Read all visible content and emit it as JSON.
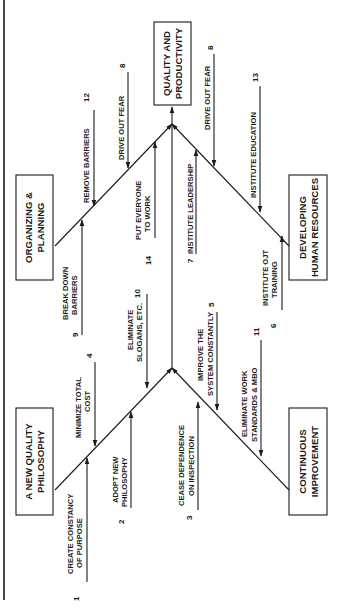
{
  "diagram": {
    "type": "cause-and-effect",
    "orientation": "rotated-90-ccw",
    "effect": {
      "label_lines": [
        "QUALITY AND",
        "PRODUCTIVITY"
      ]
    },
    "categories": [
      {
        "id": "philosophy",
        "label_lines": [
          "A NEW QUALITY",
          "PHILOSOPHY"
        ]
      },
      {
        "id": "organizing",
        "label_lines": [
          "ORGANIZING &",
          "PLANNING"
        ]
      },
      {
        "id": "continuous",
        "label_lines": [
          "CONTINUOUS",
          "IMPROVEMENT"
        ]
      },
      {
        "id": "human",
        "label_lines": [
          "DEVELOPING",
          "HUMAN RESOURCES"
        ]
      }
    ],
    "points": [
      {
        "num": "1",
        "lines": [
          "CREATE CONSTANCY",
          "OF PURPOSE"
        ]
      },
      {
        "num": "2",
        "lines": [
          "ADOPT NEW",
          "PHILOSOPHY"
        ]
      },
      {
        "num": "4",
        "lines": [
          "MINIMIZE TOTAL",
          "COST"
        ]
      },
      {
        "num": "10",
        "lines": [
          "ELIMINATE",
          "SLOGANS, ETC."
        ]
      },
      {
        "num": "9",
        "lines": [
          "BREAK DOWN",
          "BARRIERS"
        ]
      },
      {
        "num": "12",
        "lines": [
          "REMOVE BARRIERS"
        ]
      },
      {
        "num": "14",
        "lines": [
          "PUT EVERYONE",
          "TO WORK"
        ]
      },
      {
        "num": "8",
        "lines": [
          "DRIVE OUT FEAR"
        ]
      },
      {
        "num": "3",
        "lines": [
          "CEASE DEPENDENCE",
          "ON INSPECTION"
        ]
      },
      {
        "num": "5",
        "lines": [
          "IMPROVE THE",
          "SYSTEM CONSTANTLY"
        ]
      },
      {
        "num": "11",
        "lines": [
          "ELIMINATE WORK",
          "STANDARDS & MBO"
        ]
      },
      {
        "num": "7",
        "lines": [
          "INSTITUTE LEADERSHIP"
        ]
      },
      {
        "num": "6",
        "lines": [
          "INSTITUTE OJT",
          "TRAINING"
        ]
      },
      {
        "num": "13",
        "lines": [
          "INSTITUTE EDUCATION"
        ]
      },
      {
        "num": "8b",
        "display_num": "8",
        "lines": [
          "DRIVE OUT FEAR"
        ]
      }
    ]
  }
}
